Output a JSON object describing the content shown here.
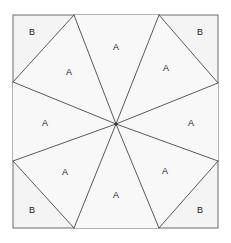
{
  "figure": {
    "type": "geometry-diagram",
    "canvas": {
      "width": 231,
      "height": 243
    },
    "background_color": "#ffffff",
    "square": {
      "name": "outer-square",
      "left": 13,
      "top": 15,
      "right": 218,
      "bottom": 228,
      "fill_color": "#f4f4f4",
      "stroke_color": "#6b6b6b",
      "stroke_width": 1
    },
    "center_point": {
      "x": 116,
      "y": 124,
      "visible": true,
      "color": "#333333",
      "radius": 1.6
    },
    "perimeter_points": [
      {
        "name": "top-left-vertex",
        "x": 74,
        "y": 15
      },
      {
        "name": "top-right-vertex",
        "x": 159,
        "y": 15
      },
      {
        "name": "right-top-vertex",
        "x": 218,
        "y": 83
      },
      {
        "name": "right-bottom-vertex",
        "x": 218,
        "y": 161
      },
      {
        "name": "bottom-right-vertex",
        "x": 159,
        "y": 228
      },
      {
        "name": "bottom-left-vertex",
        "x": 74,
        "y": 228
      },
      {
        "name": "left-bottom-vertex",
        "x": 13,
        "y": 161
      },
      {
        "name": "left-top-vertex",
        "x": 13,
        "y": 82
      }
    ],
    "triangle_fill_color": "#f8f8f8",
    "line_color": "#5a5a5a",
    "line_width": 1,
    "label_color": "#1a1a1a",
    "label_font_size": 9,
    "labels": [
      {
        "name": "label-a-top",
        "text": "A",
        "x": 116,
        "y": 48
      },
      {
        "name": "label-a-upper-right",
        "text": "A",
        "x": 166,
        "y": 69
      },
      {
        "name": "label-a-right",
        "text": "A",
        "x": 191,
        "y": 124
      },
      {
        "name": "label-a-lower-right",
        "text": "A",
        "x": 165,
        "y": 172
      },
      {
        "name": "label-a-bottom",
        "text": "A",
        "x": 116,
        "y": 196
      },
      {
        "name": "label-a-lower-left",
        "text": "A",
        "x": 65,
        "y": 173
      },
      {
        "name": "label-a-left",
        "text": "A",
        "x": 45,
        "y": 124
      },
      {
        "name": "label-a-upper-left",
        "text": "A",
        "x": 69,
        "y": 73
      },
      {
        "name": "label-b-top-left",
        "text": "B",
        "x": 32,
        "y": 33
      },
      {
        "name": "label-b-top-right",
        "text": "B",
        "x": 200,
        "y": 33
      },
      {
        "name": "label-b-bottom-left",
        "text": "B",
        "x": 32,
        "y": 211
      },
      {
        "name": "label-b-bottom-right",
        "text": "B",
        "x": 200,
        "y": 211
      }
    ],
    "spokes": [
      {
        "name": "spoke-to-top-left-vertex",
        "x1": 116,
        "y1": 124,
        "x2": 74,
        "y2": 15
      },
      {
        "name": "spoke-to-top-right-vertex",
        "x1": 116,
        "y1": 124,
        "x2": 159,
        "y2": 15
      },
      {
        "name": "spoke-to-right-top-vertex",
        "x1": 116,
        "y1": 124,
        "x2": 218,
        "y2": 83
      },
      {
        "name": "spoke-to-right-bottom-vertex",
        "x1": 116,
        "y1": 124,
        "x2": 218,
        "y2": 161
      },
      {
        "name": "spoke-to-bottom-right-vertex",
        "x1": 116,
        "y1": 124,
        "x2": 159,
        "y2": 228
      },
      {
        "name": "spoke-to-bottom-left-vertex",
        "x1": 116,
        "y1": 124,
        "x2": 74,
        "y2": 228
      },
      {
        "name": "spoke-to-left-bottom-vertex",
        "x1": 116,
        "y1": 124,
        "x2": 13,
        "y2": 161
      },
      {
        "name": "spoke-to-left-top-vertex",
        "x1": 116,
        "y1": 124,
        "x2": 13,
        "y2": 82
      }
    ],
    "chords": [
      {
        "name": "chord-top-left-to-left-top",
        "x1": 74,
        "y1": 15,
        "x2": 13,
        "y2": 82
      },
      {
        "name": "chord-top-right-to-right-top",
        "x1": 159,
        "y1": 15,
        "x2": 218,
        "y2": 83
      },
      {
        "name": "chord-right-bottom-to-bottom-right",
        "x1": 218,
        "y1": 161,
        "x2": 159,
        "y2": 228
      },
      {
        "name": "chord-bottom-left-to-left-bottom",
        "x1": 74,
        "y1": 228,
        "x2": 13,
        "y2": 161
      }
    ]
  }
}
